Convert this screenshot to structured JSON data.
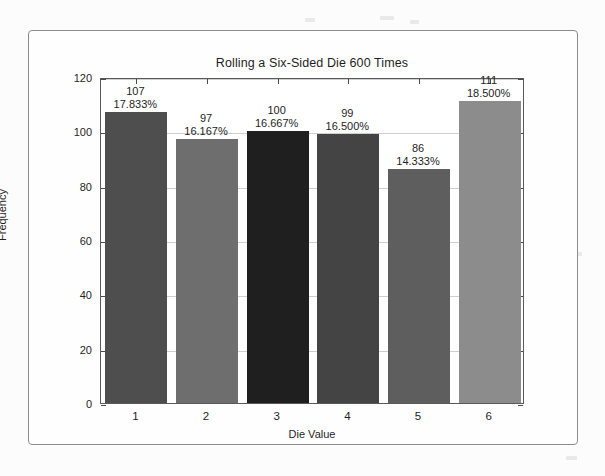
{
  "figure": {
    "title": "Rolling a Six-Sided Die 600 Times",
    "xlabel": "Die Value",
    "ylabel": "Frequency"
  },
  "chart_data": {
    "type": "bar",
    "title": "Rolling a Six-Sided Die 600 Times",
    "xlabel": "Die Value",
    "ylabel": "Frequency",
    "categories": [
      "1",
      "2",
      "3",
      "4",
      "5",
      "6"
    ],
    "values": [
      107,
      97,
      100,
      99,
      86,
      111
    ],
    "percent_labels": [
      "17.833%",
      "16.167%",
      "16.667%",
      "16.500%",
      "14.333%",
      "18.500%"
    ],
    "count_labels": [
      "107",
      "97",
      "100",
      "99",
      "86",
      "111"
    ],
    "bar_colors": [
      "#4e4e4e",
      "#6e6e6e",
      "#1f1f1f",
      "#444444",
      "#5e5e5e",
      "#8c8c8c"
    ],
    "ylim": [
      0,
      120
    ],
    "yticks": [
      "0",
      "20",
      "40",
      "60",
      "80",
      "100",
      "120"
    ],
    "ytick_values": [
      0,
      20,
      40,
      60,
      80,
      100,
      120
    ],
    "xticks": [
      "1",
      "2",
      "3",
      "4",
      "5",
      "6"
    ],
    "grid": true,
    "legend": "none",
    "total_rolls": 600
  }
}
